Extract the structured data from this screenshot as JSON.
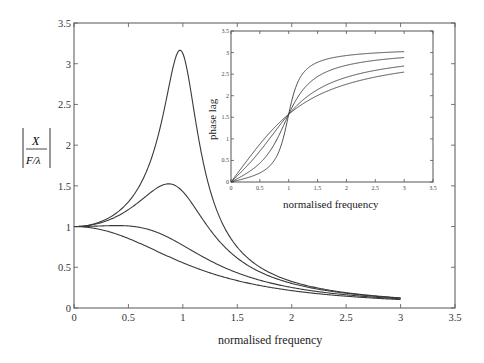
{
  "chart_data": [
    {
      "id": "main",
      "type": "line",
      "title": "",
      "xlabel": "normalised frequency",
      "ylabel": "|X / (F/λ)|",
      "ylabel_parts": {
        "numerator": "X",
        "denominator": "F/λ"
      },
      "xlim": [
        0,
        3.5
      ],
      "ylim": [
        0,
        3.5
      ],
      "xticks": [
        "0",
        "0.5",
        "1",
        "1.5",
        "2",
        "2.5",
        "3",
        "3.5"
      ],
      "yticks": [
        "0",
        "0.5",
        "1",
        "1.5",
        "2",
        "2.5",
        "3",
        "3.5"
      ],
      "grid": false,
      "legend": null,
      "x": [
        0,
        0.25,
        0.5,
        0.75,
        0.9,
        1.0,
        1.25,
        1.5,
        2.0,
        2.5,
        3.0
      ],
      "series": [
        {
          "name": "damping 0.16",
          "values": [
            1.0,
            1.06,
            1.3,
            2.03,
            3.1,
            3.12,
            1.67,
            0.75,
            0.33,
            0.19,
            0.12
          ]
        },
        {
          "name": "damping 0.35",
          "values": [
            1.0,
            1.05,
            1.23,
            1.52,
            1.48,
            1.43,
            0.99,
            0.66,
            0.32,
            0.18,
            0.12
          ]
        },
        {
          "name": "damping 0.65",
          "values": [
            1.0,
            1.02,
            1.02,
            0.96,
            0.87,
            0.77,
            0.59,
            0.47,
            0.27,
            0.17,
            0.11
          ]
        },
        {
          "name": "damping 0.9",
          "values": [
            1.0,
            0.96,
            0.8,
            0.65,
            0.6,
            0.56,
            0.46,
            0.38,
            0.25,
            0.16,
            0.11
          ]
        }
      ],
      "peaks": [
        {
          "x": 0.97,
          "y": 3.17
        },
        {
          "x": 0.87,
          "y": 1.5
        }
      ]
    },
    {
      "id": "inset",
      "type": "line",
      "title": "",
      "xlabel": "normalised frequency",
      "ylabel": "phase lag",
      "xlim": [
        0,
        3.5
      ],
      "ylim": [
        0,
        3.5
      ],
      "xticks": [
        "0",
        "0.5",
        "1",
        "1.5",
        "2",
        "2.5",
        "3",
        "3.5"
      ],
      "yticks": [
        "0",
        "0.5",
        "1",
        "1.5",
        "2",
        "2.5",
        "3",
        "3.5"
      ],
      "grid": false,
      "legend": null,
      "x": [
        0,
        0.25,
        0.5,
        0.75,
        1.0,
        1.25,
        1.5,
        2.0,
        2.5,
        3.0
      ],
      "series": [
        {
          "name": "damping 0.16",
          "values": [
            0,
            0.09,
            0.21,
            0.5,
            1.571,
            2.66,
            2.89,
            3.03,
            3.06,
            3.02
          ]
        },
        {
          "name": "damping 0.35",
          "values": [
            0,
            0.18,
            0.44,
            0.93,
            1.571,
            2.15,
            2.54,
            2.79,
            2.87,
            2.88
          ]
        },
        {
          "name": "damping 0.65",
          "values": [
            0,
            0.34,
            0.71,
            1.15,
            1.571,
            1.88,
            2.14,
            2.43,
            2.58,
            2.69
          ]
        },
        {
          "name": "damping 0.9",
          "values": [
            0,
            0.45,
            0.88,
            1.32,
            1.571,
            1.82,
            2.0,
            2.26,
            2.43,
            2.55
          ]
        }
      ],
      "damping_ratios": [
        0.16,
        0.35,
        0.65,
        0.9
      ]
    }
  ],
  "labels": {
    "main_xlabel": "normalised frequency",
    "main_ylabel_num": "X",
    "main_ylabel_den": "F/λ",
    "inset_xlabel": "normalised frequency",
    "inset_ylabel": "phase lag"
  }
}
